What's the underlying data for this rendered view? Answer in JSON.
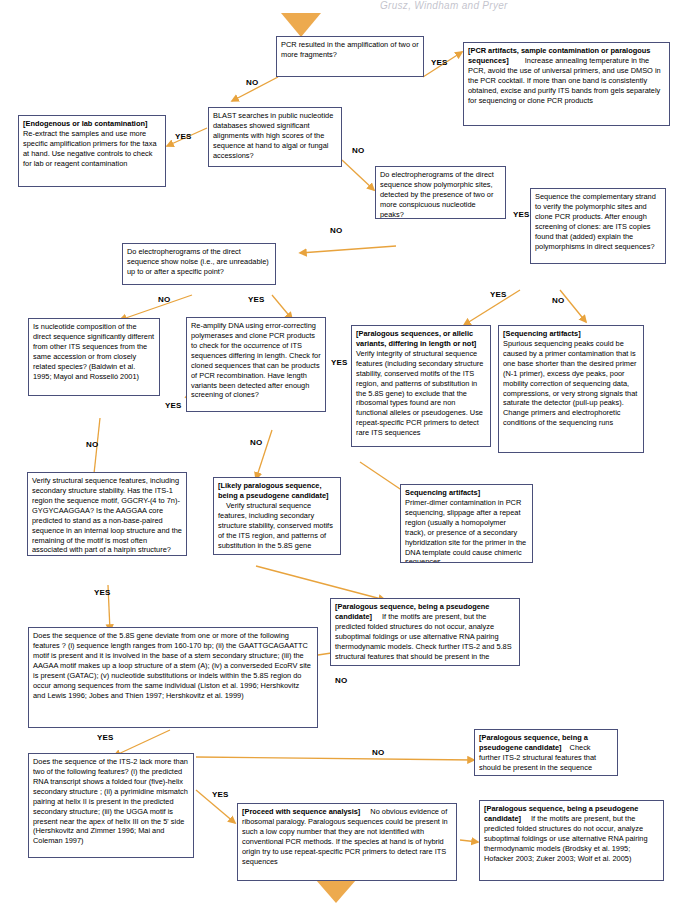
{
  "page": {
    "header_running_text": "Grusz, Windham and Pryer",
    "accent_color": "#e8a33d",
    "node_border_color": "#4a4f7a"
  },
  "labels": {
    "yes": "YES",
    "no": "NO"
  },
  "nodes": {
    "start_q": {
      "text": "PCR resulted in the amplification of two or more fragments?"
    },
    "pcr_artifacts": {
      "bold": "[PCR artifacts, sample contamination or paralogous sequences]",
      "text": "Increase annealing temperature in the PCR, avoid the use of universal primers, and use DMSO in the PCR cocktail. If more than one band is consistently obtained, excise and purify ITS bands from gels separately for sequencing or clone PCR products"
    },
    "endogenous": {
      "bold": "[Endogenous or lab contamination]",
      "text": "Re-extract the samples and use more specific amplification primers for the taxa at hand. Use negative controls to check for lab or reagent contamination"
    },
    "blast_q": {
      "text": "BLAST searches in public nucleotide databases showed significant alignments with high scores of the sequence at hand to algal or fungal accessions?"
    },
    "polymorphic_q": {
      "text": "Do electropherograms of the direct sequence show polymorphic sites, detected by the presence of two or more conspicuous nucleotide peaks?"
    },
    "sequence_complementary_q": {
      "text": "Sequence the complementary strand to verify the polymorphic sites and clone PCR products. After enough screening of clones: are ITS copies found that (added) explain the polymorphisms in direct sequences?"
    },
    "noise_q": {
      "text": "Do electropherograms of the direct sequence show noise (i.e., are unreadable) up to or after a specific point?"
    },
    "nucleotide_comp_q": {
      "text": "Is nucleotide composition of the direct sequence significantly different from other ITS sequences from the same accession or from closely related species?  (Baldwin et al. 1995; Mayol and Rosselló 2001)"
    },
    "reamplify_q": {
      "text": "Re-amplify DNA using error-correcting polymerases and clone PCR products to check for the occurrence of ITS sequences differing in length. Check for cloned sequences that can be products of PCR recombination. Have length variants been detected after enough screening of clones?"
    },
    "paralogous_allelic": {
      "bold": "[Paralogous sequences, or allelic variants, differing in length or not]",
      "text": "Verify integrity of structural sequence features (including secondary structure stability, conserved motifs of the ITS region, and patterns of substitution in the 5.8S gene) to exclude that the ribosomal types found are non functional alleles or pseudogenes. Use repeat-specific PCR primers to detect rare ITS sequences"
    },
    "sequencing_artifacts_1": {
      "bold": "[Sequencing artifacts]",
      "text": "Spurious sequencing  peaks could be caused by a primer contamination that is one base shorter than the desired primer (N-1 primer), excess dye peaks, poor mobility correction of sequencing data, compressions, or very strong signals that saturate the detector (pull-up peaks). Change primers and electrophoretic conditions of the sequencing runs"
    },
    "verify_structural": {
      "text": "Verify structural sequence features, including secondary structure stability. Has the ITS-1 region the sequence motif, GGCRY-(4 to 7n)-GYGYCAAGGAA? Is the  AAGGAA core predicted to stand as a non-base-paired sequence in an internal loop structure and the remaining of the motif is most often associated with part of a hairpin structure? (Liu and Schardl 1994; Coleman 2003)"
    },
    "likely_paralogous": {
      "bold": "[Likely paralogous sequence, being a pseudogene candidate]",
      "text": "Verify structural sequence features, including secondary structure stability, conserved motifs of the ITS region, and patterns of substitution in the 5.8S gene"
    },
    "sequencing_artifacts_2": {
      "bold": "Sequencing artifacts]",
      "text": "Primer-dimer contamination in PCR sequencing, slippage after a repeat region (usually a homopolymer track), or presence of a secondary hybridization site for the primer in  the DNA template could cause  chimeric sequences"
    },
    "paralogous_pseudo_1": {
      "bold": "[Paralogous sequence, being a pseudogene candidate]",
      "text": "If the motifs are present, but the predicted folded structures do not occur, analyze suboptimal foldings or use alternative RNA pairing thermodynamic models. Check further ITS-2 and 5.8S structural  features that should be present in the sequence"
    },
    "five_eight_s_q": {
      "text": "Does the sequence of the 5.8S gene deviate from one or more of  the following features ?     (i) sequence length ranges from 160-170 bp; (ii)  the GAATTGCAGAATTC motif is present and it is involved in the base of a stem secondary structure; (iii)  the AAGAA motif makes up a loop structure of a stem (A); (iv) a converseded EcoRV site is present (GATAC); (v) nucleotide substitutions or indels within the 5.8S region do occur among sequences from the same individual (Liston et al. 1996; Hershkovitz and Lewis 1996; Jobes and Thien 1997; Hershkovitz et al. 1999)"
    },
    "paralogous_pseudo_2": {
      "bold": "[Paralogous sequence, being a pseudogene candidate]",
      "text": "Check further ITS-2 structural  features that should be present in the sequence"
    },
    "its2_q": {
      "text": "Does the sequence of the ITS-2 lack more than two of the following features?    (i) the predicted RNA transcript shows a folded four (five)-helix secondary structure ;  (ii) a pyrimidine mismatch pairing at helix II is present in the predicted secondary structure;  (iii)  the UGGA motif is present near the apex of helix III on the 5' side (Hershkovitz and Zimmer 1996; Mai and Coleman 1997)"
    },
    "proceed": {
      "bold": "[Proceed with sequence analysis]",
      "text": "No obvious evidence of ribosomal paralogy. Paralogous sequences could be present in such a low copy number that they are not identified with conventional PCR methods. If the species at hand is of hybrid origin try to use repeat-specific PCR primers to detect rare ITS sequences"
    },
    "paralogous_pseudo_3": {
      "bold": "[Paralogous sequence, being a pseudogene candidate]",
      "text": "If the motifs are present, but the predicted folded structures do not occur, analyze suboptimal foldings or use alternative RNA pairing thermodynamic models (Brodsky et al. 1995; Hofacker 2003; Zuker 2003; Wolf et al. 2005)"
    }
  },
  "edge_labels": [
    {
      "id": "e1-no",
      "text": "NO"
    },
    {
      "id": "e1-yes",
      "text": "YES"
    },
    {
      "id": "e2-yes",
      "text": "YES"
    },
    {
      "id": "e2-no",
      "text": "NO"
    },
    {
      "id": "e3-yes",
      "text": "YES"
    },
    {
      "id": "e3-no",
      "text": "NO"
    },
    {
      "id": "e4-no",
      "text": "NO"
    },
    {
      "id": "e4-yes",
      "text": "YES"
    },
    {
      "id": "e5-yes",
      "text": "YES"
    },
    {
      "id": "e5-no",
      "text": "NO"
    },
    {
      "id": "e6-yes",
      "text": "YES"
    },
    {
      "id": "e6-no",
      "text": "NO"
    },
    {
      "id": "e7-yes",
      "text": "YES"
    },
    {
      "id": "e7-no",
      "text": "NO"
    },
    {
      "id": "e8-yes",
      "text": "YES"
    },
    {
      "id": "e8-no",
      "text": "NO"
    },
    {
      "id": "e9-yes",
      "text": "YES"
    },
    {
      "id": "e9-no",
      "text": "NO"
    },
    {
      "id": "e10-yes",
      "text": "YES"
    },
    {
      "id": "e10-no",
      "text": "NO"
    }
  ]
}
